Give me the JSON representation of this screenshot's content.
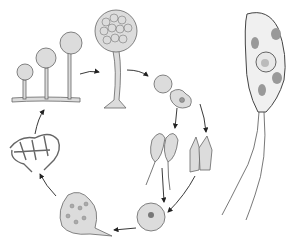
{
  "figure": {
    "labels": [],
    "stages": [
      {
        "name": "sporangia-on-stalks",
        "count": 3
      },
      {
        "name": "sorocarp-fruiting-body"
      },
      {
        "name": "spore-germination-amoeba"
      },
      {
        "name": "swarm-cells-flagellated"
      },
      {
        "name": "myxamoebae"
      },
      {
        "name": "zygote"
      },
      {
        "name": "plasmodium"
      },
      {
        "name": "reticulate-plasmodium"
      },
      {
        "name": "enlarged-flagellated-swarm-cell"
      }
    ],
    "colors": {
      "line": "#555555",
      "fill": "#dcdcdc",
      "background": "#ffffff"
    }
  }
}
